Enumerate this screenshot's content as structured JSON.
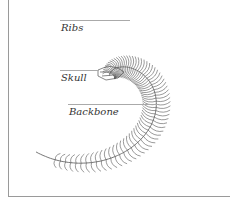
{
  "diagram": {
    "labels": [
      {
        "id": "ribs",
        "text": "Ribs"
      },
      {
        "id": "skull",
        "text": "Skull"
      },
      {
        "id": "backbone",
        "text": "Backbone"
      }
    ],
    "colors": {
      "line": "#555555",
      "frame": "#9a9a9a",
      "leader": "#aaaaaa",
      "text": "#333333"
    }
  }
}
